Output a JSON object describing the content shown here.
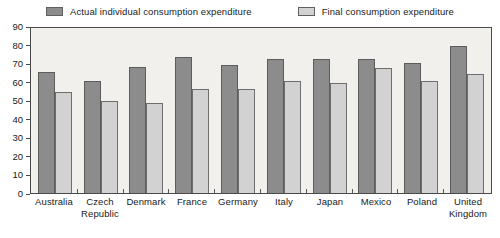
{
  "chart_data": {
    "type": "bar",
    "title": "",
    "xlabel": "",
    "ylabel": "",
    "ylim": [
      0,
      90
    ],
    "ytick_step": 10,
    "yticks": [
      90,
      80,
      70,
      60,
      50,
      40,
      30,
      20,
      10,
      0
    ],
    "grid": false,
    "legend_position": "top",
    "categories": [
      "Australia",
      "Czech Republic",
      "Denmark",
      "France",
      "Germany",
      "Italy",
      "Japan",
      "Mexico",
      "Poland",
      "United Kingdom"
    ],
    "category_lines": [
      [
        "Australia"
      ],
      [
        "Czech",
        "Republic"
      ],
      [
        "Denmark"
      ],
      [
        "France"
      ],
      [
        "Germany"
      ],
      [
        "Italy"
      ],
      [
        "Japan"
      ],
      [
        "Mexico"
      ],
      [
        "Poland"
      ],
      [
        "United",
        "Kingdom"
      ]
    ],
    "series": [
      {
        "name": "Actual individual consumption expenditure",
        "color": "#8c8c8c",
        "values": [
          66,
          61,
          69,
          74,
          70,
          73,
          73,
          73,
          71,
          80
        ]
      },
      {
        "name": "Final consumption expenditure",
        "color": "#d2d2d2",
        "values": [
          55,
          50,
          49,
          57,
          57,
          61,
          60,
          68,
          61,
          65
        ]
      }
    ]
  },
  "colors": {
    "series_0": "#8c8c8c",
    "series_1": "#d2d2d2",
    "plot_background": "#f1f0ed",
    "axis": "#4a4a4a",
    "text": "#1a1a1a"
  }
}
